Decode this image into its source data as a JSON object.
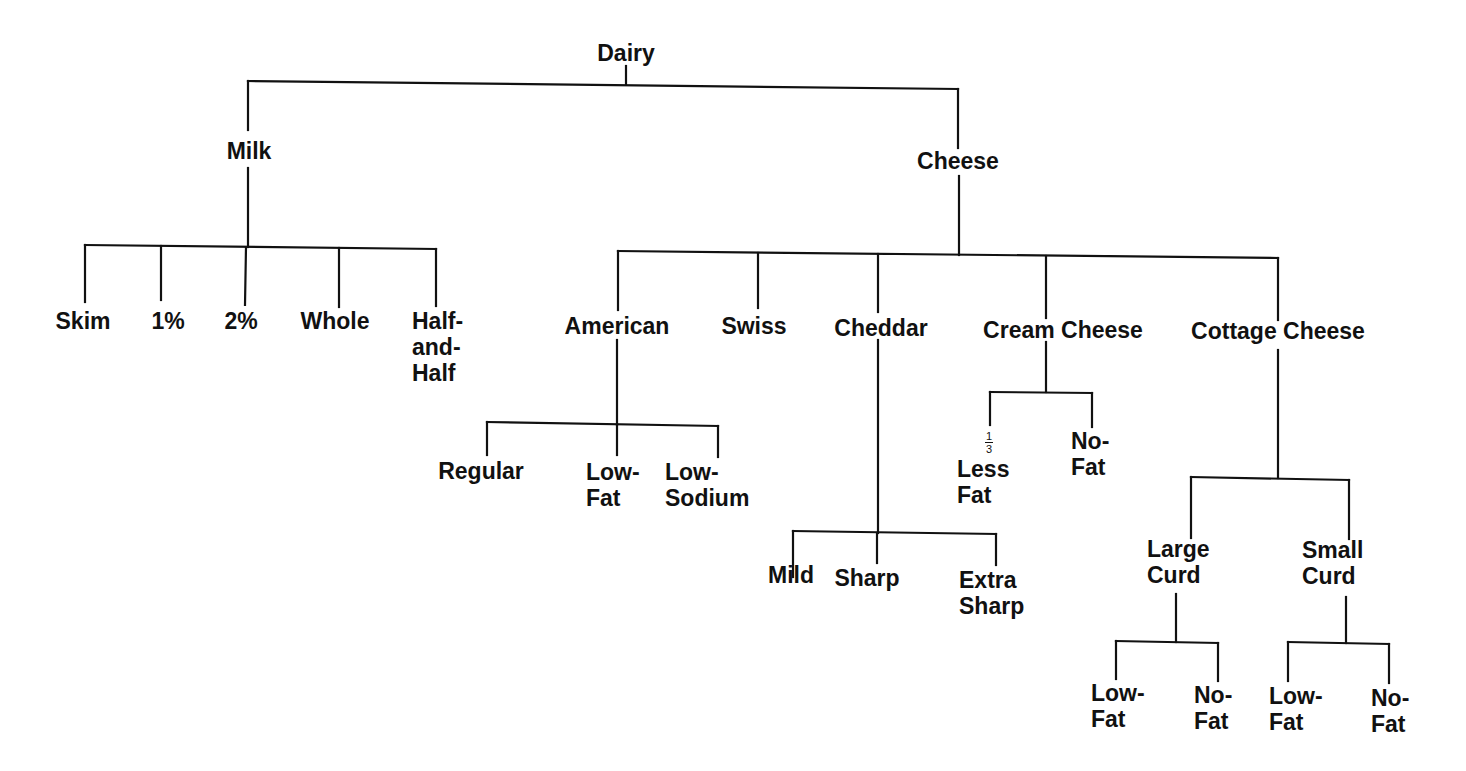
{
  "diagram": {
    "title": "Dairy",
    "root": {
      "label": "Dairy",
      "children": [
        {
          "label": "Milk",
          "children": [
            {
              "label": "Skim"
            },
            {
              "label": "1%"
            },
            {
              "label": "2%"
            },
            {
              "label": "Whole"
            },
            {
              "label": "Half-and-Half"
            }
          ]
        },
        {
          "label": "Cheese",
          "children": [
            {
              "label": "American",
              "children": [
                {
                  "label": "Regular"
                },
                {
                  "label": "Low-Fat"
                },
                {
                  "label": "Low-Sodium"
                }
              ]
            },
            {
              "label": "Swiss"
            },
            {
              "label": "Cheddar",
              "children": [
                {
                  "label": "Mild"
                },
                {
                  "label": "Sharp"
                },
                {
                  "label": "Extra Sharp"
                }
              ]
            },
            {
              "label": "Cream Cheese",
              "children": [
                {
                  "label": "1/3 Less Fat"
                },
                {
                  "label": "No-Fat"
                }
              ]
            },
            {
              "label": "Cottage Cheese",
              "children": [
                {
                  "label": "Large Curd",
                  "children": [
                    {
                      "label": "Low-Fat"
                    },
                    {
                      "label": "No-Fat"
                    }
                  ]
                },
                {
                  "label": "Small Curd",
                  "children": [
                    {
                      "label": "Low-Fat"
                    },
                    {
                      "label": "No-Fat"
                    }
                  ]
                }
              ]
            }
          ]
        }
      ]
    }
  },
  "labels": {
    "dairy": "Dairy",
    "milk": "Milk",
    "cheese": "Cheese",
    "skim": "Skim",
    "one_pct": "1%",
    "two_pct": "2%",
    "whole": "Whole",
    "half_and_half": "Half-\nand-\nHalf",
    "american": "American",
    "swiss": "Swiss",
    "cheddar": "Cheddar",
    "cream_cheese": "Cream Cheese",
    "cottage_cheese": "Cottage Cheese",
    "american_regular": "Regular",
    "american_low_fat": "Low-\nFat",
    "american_low_sodium": "Low-\nSodium",
    "cheddar_mild": "Mild",
    "cheddar_sharp": "Sharp",
    "cheddar_extra_sharp": "Extra\nSharp",
    "cream_less_fat_fraction_num": "1",
    "cream_less_fat_fraction_den": "3",
    "cream_less_fat": "Less\nFat",
    "cream_no_fat": "No-\nFat",
    "large_curd": "Large\nCurd",
    "small_curd": "Small\nCurd",
    "large_low_fat": "Low-\nFat",
    "large_no_fat": "No-\nFat",
    "small_low_fat": "Low-\nFat",
    "small_no_fat": "No-\nFat"
  },
  "colors": {
    "line": "#111111",
    "text": "#111111",
    "background": "#ffffff"
  }
}
